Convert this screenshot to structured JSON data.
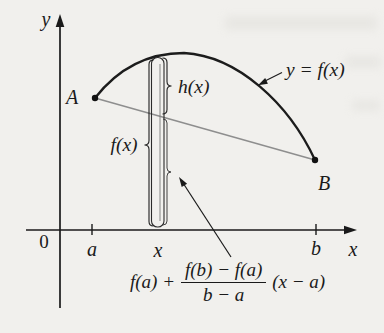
{
  "figure": {
    "type": "math-diagram",
    "description_labels": {
      "curve_label": "y = f(x)",
      "h_label": "h(x)",
      "f_label": "f(x)"
    },
    "axis": {
      "y_label": "y",
      "x_label": "x",
      "origin_label": "0"
    },
    "ticks": {
      "a": "a",
      "x": "x",
      "b": "b"
    },
    "points": {
      "A": "A",
      "B": "B"
    },
    "formula": {
      "prefix": "f(a) +",
      "numerator": "f(b) − f(a)",
      "denominator": "b − a",
      "suffix": "(x − a)"
    },
    "colors": {
      "paper": "#f1f0ed",
      "ink": "#1a1a1a",
      "curve": "#1c1c1c",
      "secant": "#8e8e8e",
      "strip_inner": "#7a7a7a"
    }
  }
}
